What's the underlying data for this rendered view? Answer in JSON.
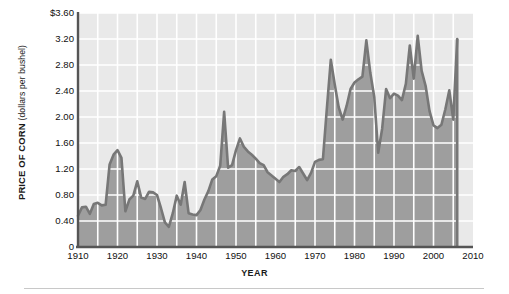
{
  "chart_data": {
    "type": "area",
    "title": "",
    "subtitle": "",
    "xlabel": "YEAR",
    "ylabel": "PRICE OF CORN (dollars per bushel)",
    "ylabel_main": "PRICE OF CORN",
    "ylabel_units": "(dollars per bushel)",
    "xlim": [
      1910,
      2010
    ],
    "ylim": [
      0,
      3.6
    ],
    "grid": true,
    "legend": null,
    "x_ticks": [
      1910,
      1920,
      1930,
      1940,
      1950,
      1960,
      1970,
      1980,
      1990,
      2000,
      2010
    ],
    "x_tick_labels": [
      "1910",
      "1920",
      "1930",
      "1940",
      "1950",
      "1960",
      "1970",
      "1980",
      "1990",
      "2000",
      "2010"
    ],
    "x_minor_step": 5,
    "y_ticks": [
      0,
      0.4,
      0.8,
      1.2,
      1.6,
      2.0,
      2.4,
      2.8,
      3.2,
      3.6
    ],
    "y_tick_labels": [
      "0",
      "0.40",
      "0.80",
      "1.20",
      "1.60",
      "2.00",
      "2.40",
      "2.80",
      "3.20",
      "$3.60"
    ],
    "series_name": "Price of corn",
    "x": [
      1910,
      1911,
      1912,
      1913,
      1914,
      1915,
      1916,
      1917,
      1918,
      1919,
      1920,
      1921,
      1922,
      1923,
      1924,
      1925,
      1926,
      1927,
      1928,
      1929,
      1930,
      1931,
      1932,
      1933,
      1934,
      1935,
      1936,
      1937,
      1938,
      1939,
      1940,
      1941,
      1942,
      1943,
      1944,
      1945,
      1946,
      1947,
      1948,
      1949,
      1950,
      1951,
      1952,
      1953,
      1954,
      1955,
      1956,
      1957,
      1958,
      1959,
      1960,
      1961,
      1962,
      1963,
      1964,
      1965,
      1966,
      1967,
      1968,
      1969,
      1970,
      1971,
      1972,
      1973,
      1974,
      1975,
      1976,
      1977,
      1978,
      1979,
      1980,
      1981,
      1982,
      1983,
      1984,
      1985,
      1986,
      1987,
      1988,
      1989,
      1990,
      1991,
      1992,
      1993,
      1994,
      1995,
      1996,
      1997,
      1998,
      1999,
      2000,
      2001,
      2002,
      2003,
      2004,
      2005,
      2006
    ],
    "values": [
      0.48,
      0.61,
      0.62,
      0.51,
      0.66,
      0.68,
      0.64,
      0.65,
      1.27,
      1.42,
      1.49,
      1.37,
      0.55,
      0.73,
      0.79,
      1.01,
      0.76,
      0.74,
      0.85,
      0.84,
      0.8,
      0.6,
      0.38,
      0.31,
      0.52,
      0.79,
      0.65,
      1.0,
      0.52,
      0.5,
      0.49,
      0.57,
      0.73,
      0.86,
      1.04,
      1.09,
      1.25,
      2.08,
      1.22,
      1.26,
      1.49,
      1.67,
      1.54,
      1.47,
      1.42,
      1.36,
      1.29,
      1.26,
      1.15,
      1.1,
      1.05,
      1.0,
      1.08,
      1.12,
      1.18,
      1.17,
      1.23,
      1.13,
      1.03,
      1.14,
      1.31,
      1.34,
      1.35,
      2.13,
      2.88,
      2.5,
      2.15,
      1.96,
      2.17,
      2.43,
      2.53,
      2.58,
      2.62,
      3.18,
      2.68,
      2.31,
      1.45,
      1.82,
      2.43,
      2.29,
      2.36,
      2.33,
      2.26,
      2.51,
      3.1,
      2.59,
      3.25,
      2.71,
      2.48,
      2.09,
      1.87,
      1.83,
      1.88,
      2.12,
      2.41,
      1.96,
      3.2
    ],
    "annotations": [],
    "colors": {
      "line": "#777777",
      "fill": "#9e9e9e",
      "plot_background": "#e9e9e9",
      "gridline": "#ffffff",
      "axis": "#555555",
      "text": "#111111"
    }
  }
}
